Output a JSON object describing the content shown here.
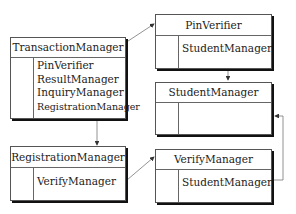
{
  "diagram": {
    "boxes": [
      {
        "id": "transaction-manager",
        "title": "TransactionManager",
        "items": [
          "PinVerifier",
          "ResultManager",
          "InquiryManager",
          "RegistrationManager"
        ]
      },
      {
        "id": "pin-verifier",
        "title": "PinVerifier",
        "items": [
          "StudentManager"
        ]
      },
      {
        "id": "student-manager",
        "title": "StudentManager",
        "items": []
      },
      {
        "id": "registration-manager",
        "title": "RegistrationManager",
        "items": [
          "VerifyManager"
        ]
      },
      {
        "id": "verify-manager",
        "title": "VerifyManager",
        "items": [
          "StudentManager"
        ]
      }
    ],
    "links": [
      {
        "from": "transaction-manager.PinVerifier",
        "to": "pin-verifier"
      },
      {
        "from": "pin-verifier.StudentManager",
        "to": "student-manager"
      },
      {
        "from": "transaction-manager",
        "to": "registration-manager"
      },
      {
        "from": "registration-manager.VerifyManager",
        "to": "verify-manager"
      },
      {
        "from": "verify-manager.StudentManager",
        "to": "student-manager"
      }
    ]
  }
}
